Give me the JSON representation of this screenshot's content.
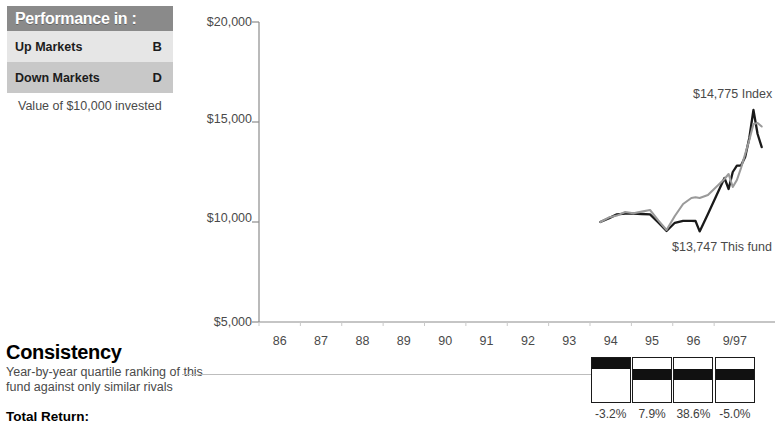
{
  "performance_box": {
    "title": "Performance in :",
    "rows": [
      {
        "label": "Up Markets",
        "grade": "B"
      },
      {
        "label": "Down Markets",
        "grade": "D"
      }
    ],
    "caption": "Value of $10,000 invested"
  },
  "consistency": {
    "heading": "Consistency",
    "description_line1": "Year-by-year quartile ranking of this",
    "description_line2": "fund against only similar rivals",
    "total_return_label": "Total Return:",
    "quartiles": [
      {
        "year": "94",
        "rank": 1,
        "return": "-3.2%"
      },
      {
        "year": "95",
        "rank": 2,
        "return": "7.9%"
      },
      {
        "year": "96",
        "rank": 2,
        "return": "38.6%"
      },
      {
        "year": "9/97",
        "rank": 2,
        "return": "-5.0%"
      }
    ]
  },
  "chart_data": {
    "type": "line",
    "title": "",
    "xlabel": "",
    "ylabel": "",
    "ylim": [
      5000,
      20000
    ],
    "yticks": [
      5000,
      10000,
      15000,
      20000
    ],
    "ytick_labels": [
      "$5,000",
      "$10,000",
      "$15,000",
      "$20,000"
    ],
    "x": [
      "86",
      "87",
      "88",
      "89",
      "90",
      "91",
      "92",
      "93",
      "94",
      "95",
      "96",
      "9/97"
    ],
    "xtick_labels": [
      "86",
      "87",
      "88",
      "89",
      "90",
      "91",
      "92",
      "93",
      "94",
      "95",
      "96",
      "9/97"
    ],
    "grid": false,
    "legend": "none",
    "annotations": [
      {
        "text": "$14,775 Index",
        "series": "Index"
      },
      {
        "text": "$13,747 This fund",
        "series": "This fund"
      }
    ],
    "series": [
      {
        "name": "This fund",
        "color": "#1a1a1a",
        "end_value": 13747,
        "start_x": 93.75,
        "points": [
          [
            93.75,
            10000
          ],
          [
            93.95,
            10180
          ],
          [
            94.15,
            10380
          ],
          [
            94.35,
            10420
          ],
          [
            94.55,
            10420
          ],
          [
            94.75,
            10400
          ],
          [
            94.95,
            10380
          ],
          [
            95.15,
            9980
          ],
          [
            95.35,
            9550
          ],
          [
            95.55,
            9960
          ],
          [
            95.75,
            10060
          ],
          [
            95.95,
            10060
          ],
          [
            96.05,
            10050
          ],
          [
            96.15,
            9530
          ],
          [
            96.35,
            10400
          ],
          [
            96.55,
            11300
          ],
          [
            96.75,
            12200
          ],
          [
            96.85,
            11650
          ],
          [
            96.95,
            12500
          ],
          [
            97.05,
            12820
          ],
          [
            97.15,
            12820
          ],
          [
            97.25,
            13250
          ],
          [
            97.35,
            14200
          ],
          [
            97.45,
            15600
          ],
          [
            97.55,
            14400
          ],
          [
            97.65,
            13747
          ]
        ]
      },
      {
        "name": "Index",
        "color": "#9a9a9a",
        "end_value": 14775,
        "start_x": 93.75,
        "points": [
          [
            93.75,
            10000
          ],
          [
            93.95,
            10220
          ],
          [
            94.15,
            10320
          ],
          [
            94.35,
            10500
          ],
          [
            94.55,
            10440
          ],
          [
            94.75,
            10520
          ],
          [
            94.95,
            10600
          ],
          [
            95.15,
            10080
          ],
          [
            95.35,
            9600
          ],
          [
            95.55,
            10300
          ],
          [
            95.75,
            10900
          ],
          [
            95.95,
            11200
          ],
          [
            96.05,
            11240
          ],
          [
            96.15,
            11200
          ],
          [
            96.35,
            11350
          ],
          [
            96.55,
            11750
          ],
          [
            96.75,
            12150
          ],
          [
            96.85,
            12400
          ],
          [
            96.95,
            11750
          ],
          [
            97.05,
            12100
          ],
          [
            97.15,
            12700
          ],
          [
            97.25,
            13400
          ],
          [
            97.35,
            14100
          ],
          [
            97.45,
            14900
          ],
          [
            97.55,
            14950
          ],
          [
            97.65,
            14775
          ]
        ]
      }
    ]
  },
  "axis_colors": {
    "axis_line": "#8c8c8c",
    "text": "#4a4a4a",
    "fund_line": "#1a1a1a",
    "index_line": "#9a9a9a"
  }
}
